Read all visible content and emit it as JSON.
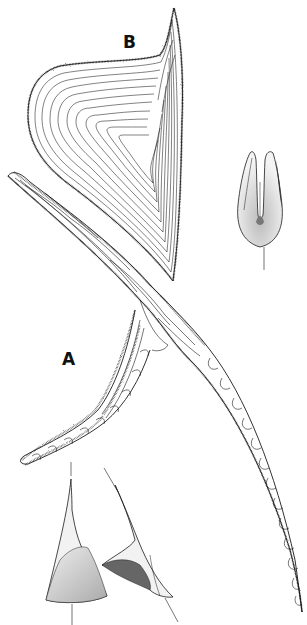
{
  "figure": {
    "labels": {
      "a": "A",
      "b": "B"
    },
    "colors": {
      "ink": "#1a1a1a",
      "stipple": "#555555",
      "shade": "#888888",
      "background": "#ffffff"
    },
    "elements": [
      {
        "id": "B",
        "description": "Large triangular plate with concentric growth lines and stippled margin"
      },
      {
        "id": "A",
        "description": "Long curved branched structure with segmented denticles along the outer arm"
      },
      {
        "id": "detail-bifid",
        "description": "Bifid (two-pronged) element in front view with pointer line"
      },
      {
        "id": "detail-cones",
        "description": "Two conical elements with shaded basal cavities and pointer lines"
      }
    ]
  }
}
